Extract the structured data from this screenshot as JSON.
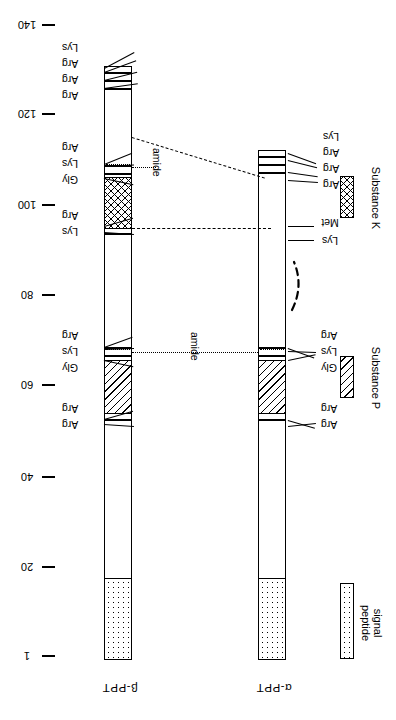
{
  "figure": {
    "orientation": "rotated-180",
    "axis": {
      "label": "amino acid residue number",
      "ticks": [
        {
          "value": "140",
          "y": 25
        },
        {
          "value": "120",
          "y": 114
        },
        {
          "value": "100",
          "y": 205
        },
        {
          "value": "80",
          "y": 295
        },
        {
          "value": "60",
          "y": 385
        },
        {
          "value": "40",
          "y": 477
        },
        {
          "value": "20",
          "y": 567
        },
        {
          "value": "1",
          "y": 656
        }
      ]
    },
    "bars": [
      {
        "id": "beta-ppt",
        "name": "β-PPT",
        "x": 104,
        "width": 28,
        "top": 66,
        "bottom": 660,
        "residue_labels": [
          {
            "text": "Lys",
            "y": 52,
            "tx": 68,
            "ty": 47
          },
          {
            "text": "Arg",
            "y": 70,
            "tx": 68,
            "ty": 63
          },
          {
            "text": "Arg",
            "y": 79,
            "tx": 68,
            "ty": 79
          },
          {
            "text": "Arg",
            "y": 88,
            "tx": 68,
            "ty": 95
          },
          {
            "text": "Arg",
            "y": 155,
            "tx": 68,
            "ty": 142
          },
          {
            "text": "Lys",
            "y": 163,
            "tx": 68,
            "ty": 158
          },
          {
            "text": "Gly",
            "y": 172,
            "tx": 68,
            "ty": 175
          },
          {
            "text": "Arg",
            "y": 216,
            "tx": 68,
            "ty": 211
          },
          {
            "text": "Lys",
            "y": 224,
            "tx": 68,
            "ty": 228
          },
          {
            "text": "Arg",
            "y": 338,
            "tx": 68,
            "ty": 331
          },
          {
            "text": "Lys",
            "y": 346,
            "tx": 68,
            "ty": 347
          },
          {
            "text": "Gly",
            "y": 355,
            "tx": 68,
            "ty": 363
          },
          {
            "text": "Arg",
            "y": 413,
            "tx": 68,
            "ty": 404
          },
          {
            "text": "Arg",
            "y": 421,
            "tx": 68,
            "ty": 421
          }
        ]
      },
      {
        "id": "alpha-ppt",
        "name": "α-PPT",
        "x": 258,
        "width": 28,
        "top": 150,
        "bottom": 660,
        "residue_labels": [
          {
            "text": "Lys",
            "y": 156,
            "tx": 300,
            "ty": 136
          },
          {
            "text": "Arg",
            "y": 165,
            "tx": 300,
            "ty": 152
          },
          {
            "text": "Arg",
            "y": 174,
            "tx": 300,
            "ty": 168
          },
          {
            "text": "Arg",
            "y": 183,
            "tx": 300,
            "ty": 184
          },
          {
            "text": "Met",
            "y": 228,
            "tx": 300,
            "ty": 222
          },
          {
            "text": "Lys",
            "y": 240,
            "tx": 300,
            "ty": 240
          },
          {
            "text": "Arg",
            "y": 338,
            "tx": 300,
            "ty": 331
          },
          {
            "text": "Lys",
            "y": 346,
            "tx": 300,
            "ty": 347
          },
          {
            "text": "Gly",
            "y": 355,
            "tx": 300,
            "ty": 363
          },
          {
            "text": "Arg",
            "y": 413,
            "tx": 300,
            "ty": 404
          },
          {
            "text": "Arg",
            "y": 421,
            "tx": 300,
            "ty": 421
          }
        ]
      }
    ],
    "amide_labels": [
      {
        "text": "amide",
        "x": 158,
        "y": 168
      },
      {
        "text": "amide",
        "x": 196,
        "y": 352
      }
    ],
    "legend": [
      {
        "label": "Substance K",
        "pattern": "crosshatch",
        "box_y": 176,
        "box_h": 42,
        "text_y": 176
      },
      {
        "label": "Substance P",
        "pattern": "hatch",
        "box_y": 356,
        "box_h": 42,
        "text_y": 352
      },
      {
        "label": "signal\npeptide",
        "line1": "signal",
        "line2": "peptide",
        "pattern": "dots",
        "box_y": 583,
        "box_h": 76,
        "text_y": 583
      }
    ],
    "colors": {
      "ink": "#000000",
      "background": "#ffffff"
    }
  }
}
